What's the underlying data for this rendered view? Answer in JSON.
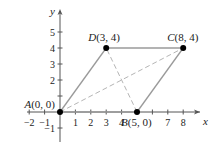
{
  "figure": {
    "type": "parallelogram-on-coordinate-plane",
    "axes": {
      "x_label": "x",
      "y_label": "y",
      "x_ticks": [
        {
          "v": -2,
          "label": "−2"
        },
        {
          "v": -1,
          "label": "−1"
        },
        {
          "v": 1,
          "label": "1"
        },
        {
          "v": 2,
          "label": "2"
        },
        {
          "v": 3,
          "label": "3"
        },
        {
          "v": 4,
          "label": "4"
        },
        {
          "v": 6,
          "label": ""
        },
        {
          "v": 7,
          "label": "7"
        },
        {
          "v": 8,
          "label": "8"
        }
      ],
      "y_ticks": [
        {
          "v": -1,
          "label": "−1"
        },
        {
          "v": 1,
          "label": ""
        },
        {
          "v": 2,
          "label": "2"
        },
        {
          "v": 3,
          "label": "3"
        },
        {
          "v": 4,
          "label": "4"
        },
        {
          "v": 5,
          "label": "5"
        }
      ]
    },
    "points": [
      {
        "id": "A",
        "label": "A(0, 0)",
        "x": 0,
        "y": 0
      },
      {
        "id": "B",
        "label": "B(5, 0)",
        "x": 5,
        "y": 0
      },
      {
        "id": "C",
        "label": "C(8, 4)",
        "x": 8,
        "y": 4
      },
      {
        "id": "D",
        "label": "D(3, 4)",
        "x": 3,
        "y": 4
      }
    ],
    "sides": [
      [
        "A",
        "B"
      ],
      [
        "B",
        "C"
      ],
      [
        "C",
        "D"
      ],
      [
        "D",
        "A"
      ]
    ],
    "diagonals": [
      [
        "A",
        "C"
      ],
      [
        "B",
        "D"
      ]
    ],
    "colors": {
      "axis": "#555555",
      "side": "#9a9a9a",
      "diagonal": "#b5b5b5",
      "point": "#000000",
      "text": "#222222"
    }
  }
}
